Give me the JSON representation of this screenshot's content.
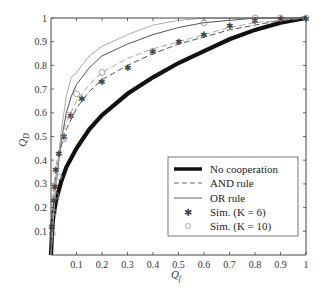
{
  "chart_data": {
    "type": "line",
    "title": "",
    "xlabel": "Q_f",
    "ylabel": "Q_D",
    "xlim": [
      0,
      1
    ],
    "ylim": [
      0,
      1
    ],
    "grid": false,
    "legend_position": "lower right (inside)",
    "x_ticks": [
      "0.1",
      "0.2",
      "0.3",
      "0.4",
      "0.5",
      "0.6",
      "0.7",
      "0.8",
      "0.9",
      "1"
    ],
    "y_ticks": [
      "0.1",
      "0.2",
      "0.3",
      "0.4",
      "0.5",
      "0.6",
      "0.7",
      "0.8",
      "0.9",
      "1"
    ],
    "series": [
      {
        "name": "No cooperation",
        "style": "thick solid black",
        "x": [
          0,
          0.005,
          0.01,
          0.02,
          0.04,
          0.06,
          0.1,
          0.15,
          0.2,
          0.3,
          0.4,
          0.5,
          0.6,
          0.7,
          0.8,
          0.9,
          1.0
        ],
        "y": [
          0,
          0.12,
          0.17,
          0.23,
          0.31,
          0.37,
          0.45,
          0.53,
          0.59,
          0.68,
          0.75,
          0.81,
          0.86,
          0.91,
          0.95,
          0.98,
          1.0
        ]
      },
      {
        "name": "AND rule",
        "style": "dashed gray",
        "x": [
          0,
          0.005,
          0.01,
          0.02,
          0.04,
          0.06,
          0.1,
          0.15,
          0.2,
          0.3,
          0.4,
          0.5,
          0.6,
          0.7,
          0.8,
          0.9,
          1.0
        ],
        "y": [
          0,
          0.18,
          0.26,
          0.35,
          0.46,
          0.53,
          0.62,
          0.69,
          0.74,
          0.8,
          0.85,
          0.89,
          0.92,
          0.95,
          0.97,
          0.99,
          1.0
        ]
      },
      {
        "name": "OR rule",
        "style": "thin solid gray",
        "x": [
          0,
          0.005,
          0.01,
          0.02,
          0.04,
          0.06,
          0.08,
          0.1,
          0.15,
          0.2,
          0.3,
          0.4,
          0.5,
          0.6,
          0.7,
          0.8,
          0.9,
          1.0
        ],
        "y": [
          0,
          0.1,
          0.18,
          0.3,
          0.48,
          0.6,
          0.67,
          0.72,
          0.79,
          0.84,
          0.89,
          0.93,
          0.96,
          0.98,
          0.99,
          1.0,
          1.0,
          1.0
        ]
      },
      {
        "name": "OR rule (K=10 curve, light)",
        "style": "thin solid light gray",
        "x": [
          0,
          0.005,
          0.01,
          0.02,
          0.04,
          0.06,
          0.08,
          0.1,
          0.15,
          0.2,
          0.3,
          0.4,
          0.5,
          0.6,
          0.7,
          1.0
        ],
        "y": [
          0,
          0.08,
          0.16,
          0.3,
          0.52,
          0.67,
          0.75,
          0.77,
          0.84,
          0.88,
          0.93,
          0.97,
          0.99,
          1.0,
          1.0,
          1.0
        ]
      },
      {
        "name": "AND rule (K=10 curve, light)",
        "style": "dashed light gray",
        "x": [
          0,
          0.005,
          0.01,
          0.02,
          0.04,
          0.06,
          0.1,
          0.15,
          0.2,
          0.3,
          0.4,
          0.5,
          0.6,
          0.7,
          0.8,
          0.9,
          1.0
        ],
        "y": [
          0,
          0.19,
          0.28,
          0.38,
          0.49,
          0.56,
          0.65,
          0.72,
          0.77,
          0.83,
          0.87,
          0.9,
          0.93,
          0.96,
          0.98,
          0.99,
          1.0
        ]
      },
      {
        "name": "Sim. (K = 6)",
        "style": "asterisk markers",
        "x": [
          0.005,
          0.01,
          0.015,
          0.02,
          0.03,
          0.05,
          0.08,
          0.12,
          0.2,
          0.3,
          0.4,
          0.5,
          0.6,
          0.7,
          0.8,
          0.9,
          1.0
        ],
        "y": [
          0.12,
          0.23,
          0.29,
          0.36,
          0.43,
          0.5,
          0.59,
          0.66,
          0.73,
          0.79,
          0.86,
          0.9,
          0.93,
          0.97,
          0.99,
          1.0,
          1.0
        ]
      },
      {
        "name": "Sim. (K = 10)",
        "style": "open circle markers",
        "x": [
          0.005,
          0.01,
          0.02,
          0.03,
          0.05,
          0.07,
          0.1,
          0.2,
          0.4,
          0.6,
          0.8,
          0.9,
          1.0
        ],
        "y": [
          0.09,
          0.18,
          0.25,
          0.33,
          0.49,
          0.59,
          0.68,
          0.77,
          0.86,
          0.98,
          1.0,
          1.0,
          1.0
        ]
      }
    ]
  },
  "legend": {
    "items": [
      {
        "label": "No cooperation",
        "symbol": "thick-line"
      },
      {
        "label": "AND rule",
        "symbol": "dashed-line"
      },
      {
        "label": "OR rule",
        "symbol": "thin-line"
      },
      {
        "label": "Sim. (K = 6)",
        "symbol": "asterisk"
      },
      {
        "label": "Sim. (K = 10)",
        "symbol": "circle"
      }
    ]
  },
  "axes": {
    "xlabel_main": "Q",
    "xlabel_sub": "f",
    "ylabel_main": "Q",
    "ylabel_sub": "D"
  },
  "colors": {
    "axis": "#444444",
    "no_cooperation": "#111111",
    "and_rule": "#555555",
    "or_rule": "#555555",
    "light_curve": "#aaaaaa"
  }
}
